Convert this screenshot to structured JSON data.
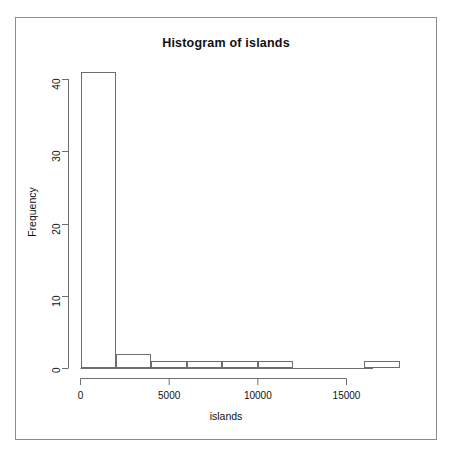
{
  "window": {
    "frame_border_color": "#8c8c8c",
    "background": "#ffffff"
  },
  "chart_data": {
    "type": "bar",
    "title": "Histogram of islands",
    "xlabel": "islands",
    "ylabel": "Frequency",
    "bin_width": 2000,
    "bin_edges": [
      0,
      2000,
      4000,
      6000,
      8000,
      10000,
      12000,
      14000,
      16000,
      18000
    ],
    "categories": [
      "0-2000",
      "2000-4000",
      "4000-6000",
      "6000-8000",
      "8000-10000",
      "10000-12000",
      "12000-14000",
      "14000-16000",
      "16000-18000"
    ],
    "values": [
      41,
      2,
      1,
      1,
      1,
      1,
      0,
      0,
      1
    ],
    "xlim": [
      0,
      18000
    ],
    "ylim": [
      0,
      41
    ],
    "xticks": [
      0,
      5000,
      10000,
      15000
    ],
    "xtick_labels": [
      "0",
      "5000",
      "10000",
      "15000"
    ],
    "yticks": [
      0,
      10,
      20,
      30,
      40
    ],
    "ytick_labels": [
      "0",
      "10",
      "20",
      "30",
      "40"
    ],
    "grid": false,
    "legend": false,
    "bar_fill": "#ffffff",
    "bar_edge_color": "#6e6e6e",
    "axis_color": "#6e6e6e"
  }
}
